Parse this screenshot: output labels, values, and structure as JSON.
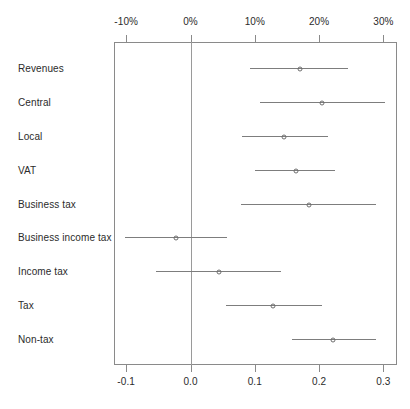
{
  "chart_data": {
    "type": "scatter",
    "subtype": "coefficient-plot-with-error-bars",
    "title": "",
    "xlabel": "",
    "ylabel": "",
    "grid": false,
    "legend": null,
    "zero_reference_line": 0.0,
    "marker_style": "open-circle",
    "xlim": [
      -0.115,
      0.32
    ],
    "top_axis": {
      "tick_values": [
        -0.1,
        0.0,
        0.1,
        0.2,
        0.3
      ],
      "tick_labels": [
        "-10%",
        "0%",
        "10%",
        "20%",
        "30%"
      ]
    },
    "bottom_axis": {
      "tick_values": [
        -0.1,
        0.0,
        0.1,
        0.2,
        0.3
      ],
      "tick_labels": [
        "-0.1",
        "0.0",
        "0.1",
        "0.2",
        "0.3"
      ]
    },
    "categories": [
      "Revenues",
      "Central",
      "Local",
      "VAT",
      "Business tax",
      "Business income tax",
      "Income tax",
      "Tax",
      "Non-tax"
    ],
    "points": [
      {
        "label": "Revenues",
        "estimate": 0.17,
        "low": 0.092,
        "high": 0.245
      },
      {
        "label": "Central",
        "estimate": 0.205,
        "low": 0.108,
        "high": 0.303
      },
      {
        "label": "Local",
        "estimate": 0.145,
        "low": 0.08,
        "high": 0.214
      },
      {
        "label": "VAT",
        "estimate": 0.164,
        "low": 0.1,
        "high": 0.225
      },
      {
        "label": "Business tax",
        "estimate": 0.184,
        "low": 0.078,
        "high": 0.288
      },
      {
        "label": "Business income tax",
        "estimate": -0.022,
        "low": -0.102,
        "high": 0.056
      },
      {
        "label": "Income tax",
        "estimate": 0.044,
        "low": -0.053,
        "high": 0.141
      },
      {
        "label": "Tax",
        "estimate": 0.128,
        "low": 0.055,
        "high": 0.205
      },
      {
        "label": "Non-tax",
        "estimate": 0.222,
        "low": 0.158,
        "high": 0.288
      }
    ]
  },
  "colors": {
    "frame": "#8a8a8a",
    "line": "#7d7d7d",
    "marker": "#6e6e6e",
    "zero_line": "#9a9a9a",
    "text": "#2b2b2b",
    "background": "#ffffff"
  }
}
